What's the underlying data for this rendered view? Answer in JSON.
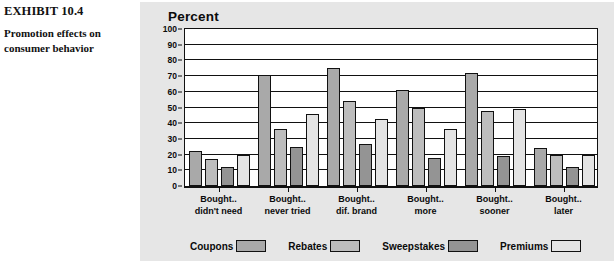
{
  "caption": {
    "exhibit_number": "EXHIBIT 10.4",
    "exhibit_title": "Promotion effects on consumer behavior"
  },
  "chart_title": "Percent",
  "colors": {
    "panel_background": "#e6e6e6",
    "plot_background": "#ffffff",
    "axis": "#111111",
    "coupons": "#a9a9a9",
    "rebates": "#bdbdbd",
    "sweepstakes": "#949494",
    "premiums": "#e4e4e4"
  },
  "chart_data": {
    "type": "bar",
    "title": "Percent",
    "xlabel": "",
    "ylabel": "Percent",
    "ylim": [
      0,
      100
    ],
    "yticks": [
      0,
      10,
      20,
      30,
      40,
      50,
      60,
      70,
      80,
      90,
      100
    ],
    "grid": true,
    "legend_position": "bottom",
    "categories": [
      "Bought.. didn't need",
      "Bought.. never tried",
      "Bought.. dif. brand",
      "Bought.. more",
      "Bought.. sooner",
      "Bought.. later"
    ],
    "category_lines": [
      [
        "Bought..",
        "didn't need"
      ],
      [
        "Bought..",
        "never tried"
      ],
      [
        "Bought..",
        "dif. brand"
      ],
      [
        "Bought..",
        "more"
      ],
      [
        "Bought..",
        "sooner"
      ],
      [
        "Bought..",
        "later"
      ]
    ],
    "series": [
      {
        "name": "Coupons",
        "color": "#a9a9a9",
        "values": [
          22,
          71,
          75,
          61,
          72,
          24
        ]
      },
      {
        "name": "Rebates",
        "color": "#bdbdbd",
        "values": [
          17,
          36,
          54,
          50,
          48,
          20
        ]
      },
      {
        "name": "Sweepstakes",
        "color": "#949494",
        "values": [
          12,
          25,
          27,
          18,
          19,
          12
        ]
      },
      {
        "name": "Premiums",
        "color": "#e4e4e4",
        "values": [
          20,
          46,
          43,
          36,
          49,
          20
        ]
      }
    ]
  }
}
